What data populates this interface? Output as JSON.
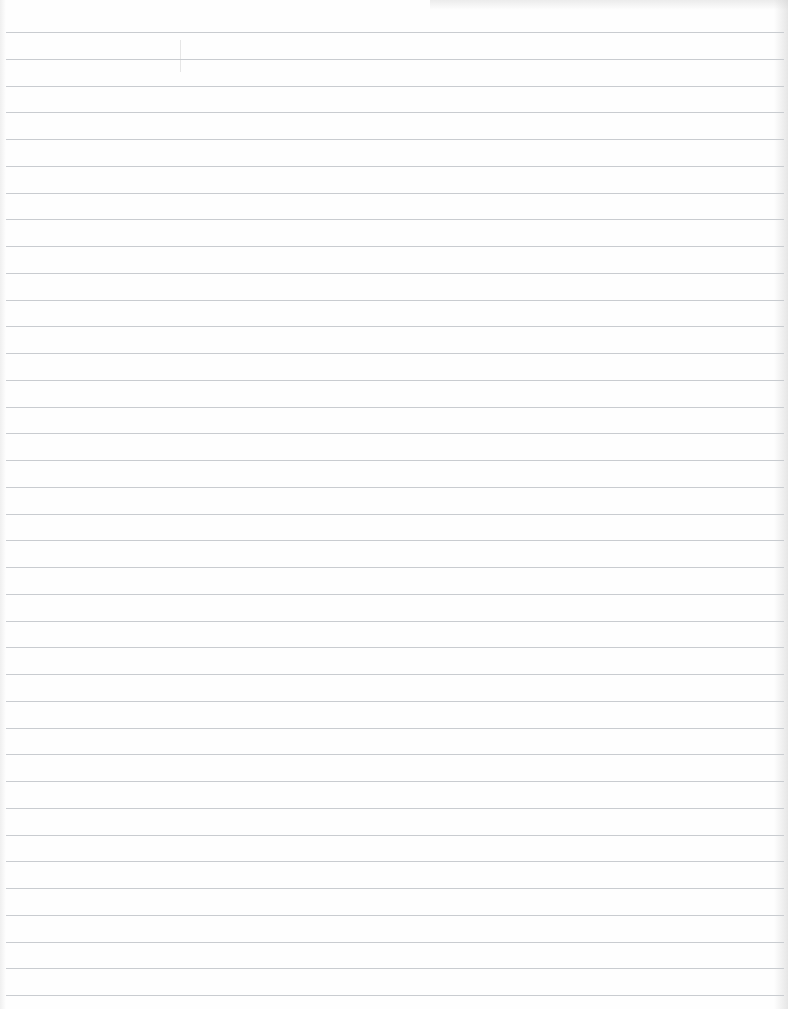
{
  "page": {
    "type": "blank-lined-paper",
    "background_color": "#fefefe",
    "rule_color": "#c9ccd0",
    "rule_count": 37,
    "first_rule_y": 32,
    "rule_spacing": 26.75
  }
}
